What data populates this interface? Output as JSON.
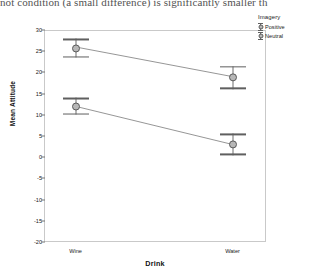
{
  "document": {
    "cut_text": "not condition (a small difference) is significantly smaller th"
  },
  "chart_data": {
    "type": "line",
    "title": "",
    "xlabel": "Drink",
    "ylabel": "Mean Attitude",
    "categories": [
      "Wine",
      "Water"
    ],
    "ylim": [
      -20,
      30
    ],
    "yticks": [
      30,
      25,
      20,
      15,
      10,
      5,
      0,
      -5,
      -10,
      -15,
      -20
    ],
    "ytick_labels": [
      "30",
      "25",
      "20",
      "15",
      "10",
      "5",
      "0",
      "-5",
      "-10",
      "-15",
      "-20"
    ],
    "grid": false,
    "legend_title": "Imagery",
    "legend_position": "top-right",
    "errorbar_type": "95% CI",
    "series": [
      {
        "name": "Positive",
        "values": [
          26.0,
          19.0
        ],
        "err_low": [
          23.5,
          16.0
        ],
        "err_high": [
          28.0,
          21.5
        ]
      },
      {
        "name": "Neutral",
        "values": [
          12.0,
          3.0
        ],
        "err_low": [
          10.0,
          0.5
        ],
        "err_high": [
          14.0,
          5.5
        ]
      }
    ],
    "colors": {
      "marker_fill": "#b7b7b7",
      "marker_edge": "#5a5a5a",
      "errorbar": "#6f6f6f",
      "line": "#8a8a8a",
      "frame": "#c9c9c9"
    }
  }
}
